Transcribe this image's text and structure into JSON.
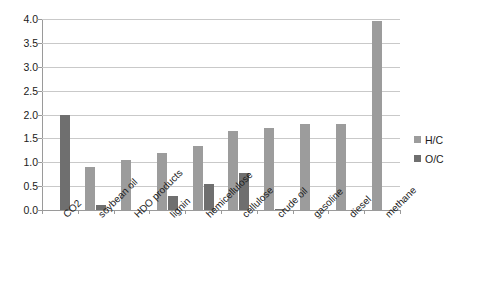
{
  "chart_data": {
    "type": "bar",
    "title": "",
    "subtitle": "",
    "xlabel": "",
    "ylabel": "",
    "ylim": [
      0,
      4.0
    ],
    "ytick_labels": [
      "4.0",
      "3.5",
      "3.0",
      "2.5",
      "2.0",
      "1.5",
      "1.0",
      "0.5",
      "0.0"
    ],
    "ytick_values": [
      4.0,
      3.5,
      3.0,
      2.5,
      2.0,
      1.5,
      1.0,
      0.5,
      0.0
    ],
    "grid": true,
    "legend_position": "right",
    "categories": [
      "CO2",
      "soybean oil",
      "HDO products",
      "lignin",
      "hemicellulose",
      "cellulose",
      "crude oil",
      "gasoline",
      "diesel",
      "methane"
    ],
    "series": [
      {
        "name": "H/C",
        "color": "#9c9c9c",
        "values": [
          0,
          0.9,
          1.05,
          1.2,
          1.35,
          1.65,
          1.72,
          1.8,
          1.8,
          3.95
        ]
      },
      {
        "name": "O/C",
        "color": "#6f6f6f",
        "values": [
          2.0,
          0.1,
          0,
          0.3,
          0.55,
          0.77,
          0.02,
          0,
          0,
          0
        ]
      }
    ]
  },
  "legend": {
    "items": [
      {
        "label": "H/C",
        "color": "#9c9c9c"
      },
      {
        "label": "O/C",
        "color": "#6f6f6f"
      }
    ]
  }
}
